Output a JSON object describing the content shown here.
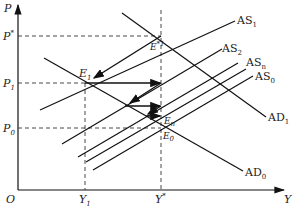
{
  "diagram": {
    "type": "AD-AS adjustment diagram",
    "axes": {
      "y_label": "P",
      "x_label": "Y",
      "origin_label": "O"
    },
    "price_levels": [
      {
        "id": "P_star",
        "base": "P",
        "sup": "*"
      },
      {
        "id": "P1",
        "base": "P",
        "sub": "1"
      },
      {
        "id": "P0",
        "base": "P",
        "sub": "0"
      }
    ],
    "output_levels": [
      {
        "id": "Y1",
        "base": "Y",
        "sub": "1"
      },
      {
        "id": "Y_star",
        "base": "Y",
        "sup": "*"
      }
    ],
    "curves": {
      "AS1": {
        "base": "AS",
        "sub": "1"
      },
      "AS2": {
        "base": "AS",
        "sub": "2"
      },
      "ASn": {
        "base": "AS",
        "sub": "n"
      },
      "AS0": {
        "base": "AS",
        "sub": "0"
      },
      "AD1": {
        "base": "AD",
        "sub": "1"
      },
      "AD0": {
        "base": "AD",
        "sub": "0"
      }
    },
    "points": {
      "E1": {
        "base": "E",
        "sub": "1"
      },
      "E_star": {
        "base": "E",
        "sup": "*",
        "sub": "1"
      },
      "En": {
        "base": "E",
        "sub": "n"
      },
      "E0": {
        "base": "E",
        "sub": "0"
      }
    }
  }
}
